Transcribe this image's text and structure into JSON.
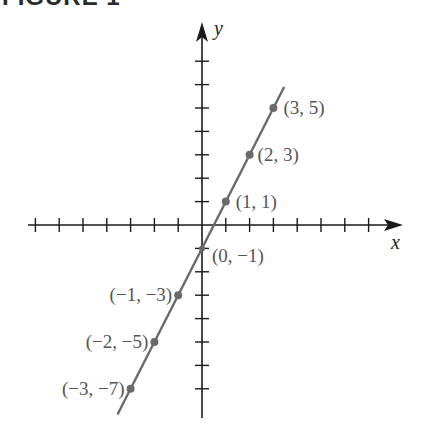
{
  "figure": {
    "title": "FIGURE 1"
  },
  "chart_data": {
    "type": "line",
    "title": "FIGURE 1",
    "xlabel": "x",
    "ylabel": "y",
    "equation_implied": "y = 2x - 1",
    "xlim": [
      -7,
      7
    ],
    "ylim": [
      -8,
      8
    ],
    "grid": false,
    "tick_labels_shown": false,
    "x_ticks": [
      -7,
      -6,
      -5,
      -4,
      -3,
      -2,
      -1,
      1,
      2,
      3,
      4,
      5,
      6,
      7
    ],
    "y_ticks": [
      -7,
      -6,
      -5,
      -4,
      -3,
      -2,
      -1,
      1,
      2,
      3,
      4,
      5,
      6,
      7
    ],
    "series": [
      {
        "name": "line",
        "points": [
          {
            "x": 3,
            "y": 5,
            "label": "(3, 5)"
          },
          {
            "x": 2,
            "y": 3,
            "label": "(2, 3)"
          },
          {
            "x": 1,
            "y": 1,
            "label": "(1, 1)"
          },
          {
            "x": 0,
            "y": -1,
            "label": "(0, −1)"
          },
          {
            "x": -1,
            "y": -3,
            "label": "(−1, −3)"
          },
          {
            "x": -2,
            "y": -5,
            "label": "(−2, −5)"
          },
          {
            "x": -3,
            "y": -7,
            "label": "(−3, −7)"
          }
        ]
      }
    ],
    "colors": {
      "axes": "#1a1a1a",
      "line": "#6a6a6a",
      "labels": "#555555"
    }
  }
}
